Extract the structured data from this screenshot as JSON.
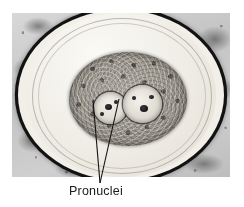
{
  "figure": {
    "kind": "light-micrograph",
    "caption_label": "Pronuclei",
    "colors": {
      "background": "#ffffff",
      "slide_background": "#c4c4c4",
      "zona_pellucida": "#121212",
      "perivitelline_space": "#f2efe9",
      "cytoplasm": "#918c84",
      "pronucleus": "#dedbd2",
      "nucleolus": "#151515",
      "leader_line": "#141414",
      "caption_text": "#1a1a1a"
    },
    "photo_bounds": {
      "x": 12,
      "y": 13,
      "width": 218,
      "height": 164
    },
    "structures": [
      {
        "name": "zona-pellucida",
        "shape": "ellipse-ring"
      },
      {
        "name": "perivitelline-space",
        "shape": "ellipse"
      },
      {
        "name": "cytoplasm",
        "shape": "ellipse"
      },
      {
        "name": "pronucleus-left",
        "shape": "circle"
      },
      {
        "name": "pronucleus-right",
        "shape": "circle"
      }
    ],
    "annotations": {
      "label": "Pronuclei",
      "leader_lines": [
        {
          "from_x": 100,
          "from_y": 183,
          "to_x": 93,
          "to_y": 100
        },
        {
          "from_x": 100,
          "from_y": 183,
          "to_x": 119,
          "to_y": 99
        }
      ]
    }
  }
}
